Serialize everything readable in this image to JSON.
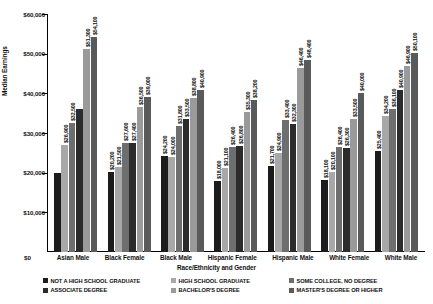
{
  "chart_data": {
    "type": "bar",
    "title": "",
    "xlabel": "Race/Ethnicity and Gender",
    "ylabel": "Median Earnings",
    "ylim": [
      0,
      60000
    ],
    "yticks": [
      "$0",
      "$10,000",
      "$20,000",
      "$30,000",
      "$40,000",
      "$50,000",
      "$60,000"
    ],
    "ytick_values": [
      0,
      10000,
      20000,
      30000,
      40000,
      50000,
      60000
    ],
    "grid": false,
    "legend_position": "bottom",
    "categories": [
      "Asian Male",
      "Black Female",
      "Black Male",
      "Hispanic Female",
      "Hispanic Male",
      "White Female",
      "White Male"
    ],
    "series": [
      {
        "name": "NOT A HIGH SCHOOL GRADUATE",
        "color": "#1c1c1c",
        "values": [
          20000,
          20200,
          24200,
          18000,
          21700,
          18100,
          25400
        ],
        "labels": [
          "",
          "$20,200",
          "$24,200",
          "$18,000",
          "$21,700",
          "$18,100",
          "$25,400"
        ]
      },
      {
        "name": "HIGH SCHOOL GRADUATE",
        "color": "#a8a8a8",
        "values": [
          26900,
          21500,
          24000,
          21100,
          24900,
          20100,
          34200
        ],
        "labels": [
          "$26,900",
          "$21,500",
          "$24,000",
          "$21,100",
          "$24,900",
          "$20,100",
          "$34,200"
        ]
      },
      {
        "name": "SOME COLLEGE, NO DEGREE",
        "color": "#6e6e6e",
        "values": [
          32500,
          27600,
          31800,
          26400,
          33400,
          26400,
          36100
        ],
        "labels": [
          "$32,500",
          "$27,600",
          "$31,800",
          "$26,400",
          "$33,400",
          "$26,400",
          "$36,100"
        ]
      },
      {
        "name": "ASSOCIATE DEGREE",
        "color": "#2b2b2b",
        "values": [
          36000,
          27400,
          33500,
          26800,
          32300,
          26300,
          40900
        ],
        "labels": [
          "",
          "$27,400",
          "$33,500",
          "$26,800",
          "$32,300",
          "$26,300",
          "$40,900"
        ]
      },
      {
        "name": "BACHELOR'S DEGREE",
        "color": "#9a9a9a",
        "values": [
          51300,
          36500,
          38800,
          35300,
          46400,
          33500,
          46900
        ],
        "labels": [
          "$51,300",
          "$36,500",
          "$38,800",
          "$35,300",
          "$46,400",
          "$33,500",
          "$46,900"
        ]
      },
      {
        "name": "MASTER'S DEGREE OR HIGHER",
        "color": "#5a5a5a",
        "values": [
          54100,
          39000,
          40900,
          38200,
          48400,
          40000,
          50100
        ],
        "labels": [
          "$54,100",
          "$39,000",
          "$40,900",
          "$38,200",
          "$48,400",
          "$40,000",
          "$50,100"
        ]
      }
    ]
  }
}
